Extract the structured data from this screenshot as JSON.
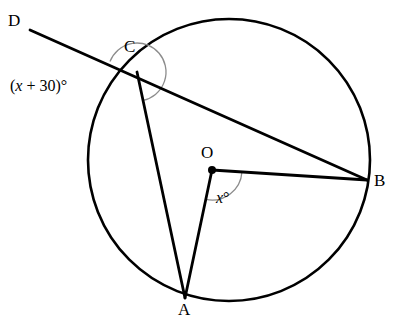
{
  "figure": {
    "kind": "circle-geometry-diagram",
    "width": 397,
    "height": 325,
    "background_color": "#ffffff",
    "stroke_color": "#000000",
    "arc_color": "#8c8c8c"
  },
  "circle": {
    "center_x": 229,
    "center_y": 160,
    "radius": 141,
    "stroke_width": 2.6
  },
  "points": {
    "A": {
      "label": "A",
      "x": 185,
      "y": 298,
      "label_x": 178,
      "label_y": 301,
      "on_circle": true
    },
    "B": {
      "label": "B",
      "x": 367,
      "y": 180,
      "label_x": 374,
      "label_y": 172,
      "on_circle": true
    },
    "C": {
      "label": "C",
      "x": 137,
      "y": 72,
      "label_x": 124,
      "label_y": 38,
      "on_circle": true
    },
    "D": {
      "label": "D",
      "x": 30,
      "y": 30,
      "label_x": 8,
      "label_y": 12,
      "on_circle": false
    },
    "O": {
      "label": "O",
      "x": 212,
      "y": 170,
      "label_x": 201,
      "label_y": 144,
      "on_circle": false,
      "dot_radius": 4
    }
  },
  "segments": [
    {
      "name": "ray-D-to-C-extended",
      "from": "D",
      "to": "B",
      "description": "secant line through D, C and on to B"
    },
    {
      "name": "chord-C-to-A",
      "from": "C",
      "to": "A"
    },
    {
      "name": "radius-O-to-A",
      "from": "O",
      "to": "A"
    },
    {
      "name": "radius-O-to-B",
      "from": "O",
      "to": "B"
    }
  ],
  "angles": [
    {
      "name": "angle-at-C",
      "vertex": "C",
      "text_parts": {
        "open": "(",
        "var": "x",
        "op": " + ",
        "num": "30",
        "close": ")",
        "degree": "°"
      },
      "full_text": "(x + 30)°",
      "label_x": 10,
      "label_y": 78,
      "arc_radius": 29
    },
    {
      "name": "angle-at-O",
      "vertex": "O",
      "text_parts": {
        "var": "x",
        "degree": "°"
      },
      "full_text": "x°",
      "label_x": 216,
      "label_y": 190,
      "arc_radius": 30
    }
  ]
}
